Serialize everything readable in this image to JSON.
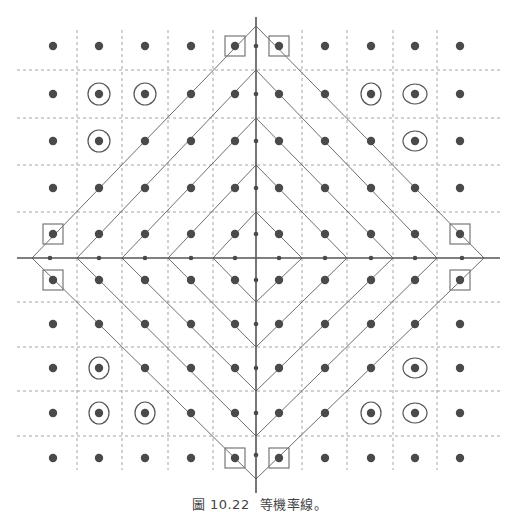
{
  "caption": {
    "figure_label": "圖 10.22",
    "title": "等機率線。"
  },
  "colors": {
    "dot": "#4a4a4a",
    "line": "#6e6e6e",
    "axis": "#555555",
    "grid": "#9a9a9a",
    "marker": "#777777"
  },
  "geometry": {
    "center": [
      256,
      258
    ],
    "h_axis": [
      17,
      500
    ],
    "v_axis": [
      17,
      493
    ],
    "dot_columns": [
      53,
      99,
      145,
      191,
      235,
      279,
      325,
      371,
      415,
      460
    ],
    "dot_rows": [
      46,
      94,
      141,
      188,
      234,
      280,
      324,
      368,
      413,
      458
    ],
    "grid_x": [
      77,
      122,
      168,
      213,
      302,
      347,
      393,
      437
    ],
    "grid_y": [
      70,
      118,
      165,
      212,
      302,
      347,
      391,
      436
    ],
    "grid_extent": {
      "x": [
        17,
        500
      ],
      "y": [
        30,
        470
      ]
    },
    "axis_dots_x": [
      50,
      99,
      145,
      191,
      235,
      279,
      325,
      371,
      415,
      462
    ],
    "axis_dots_y": [
      46,
      94,
      141,
      188,
      234,
      280,
      324,
      368,
      413,
      455
    ]
  },
  "diamonds": [
    {
      "left": 32,
      "top": 26,
      "right": 484,
      "bottom": 479
    },
    {
      "left": 77,
      "top": 70,
      "right": 437,
      "bottom": 436
    },
    {
      "left": 122,
      "top": 118,
      "right": 393,
      "bottom": 391
    },
    {
      "left": 168,
      "top": 165,
      "right": 347,
      "bottom": 347
    },
    {
      "left": 213,
      "top": 212,
      "right": 302,
      "bottom": 302
    }
  ],
  "rings": [
    {
      "x": 99,
      "y": 94,
      "rx": 11,
      "ry": 11
    },
    {
      "x": 145,
      "y": 94,
      "rx": 11,
      "ry": 11
    },
    {
      "x": 99,
      "y": 141,
      "rx": 11,
      "ry": 11
    },
    {
      "x": 371,
      "y": 94,
      "rx": 10,
      "ry": 11
    },
    {
      "x": 415,
      "y": 94,
      "rx": 12,
      "ry": 10
    },
    {
      "x": 415,
      "y": 141,
      "rx": 12,
      "ry": 10
    },
    {
      "x": 99,
      "y": 368,
      "rx": 10,
      "ry": 11
    },
    {
      "x": 99,
      "y": 413,
      "rx": 10,
      "ry": 11
    },
    {
      "x": 145,
      "y": 413,
      "rx": 10,
      "ry": 11
    },
    {
      "x": 415,
      "y": 368,
      "rx": 12,
      "ry": 10
    },
    {
      "x": 371,
      "y": 413,
      "rx": 10,
      "ry": 11
    },
    {
      "x": 415,
      "y": 413,
      "rx": 12,
      "ry": 10
    }
  ],
  "squares": [
    {
      "x": 235,
      "y": 46
    },
    {
      "x": 279,
      "y": 46
    },
    {
      "x": 53,
      "y": 234
    },
    {
      "x": 460,
      "y": 234
    },
    {
      "x": 53,
      "y": 280
    },
    {
      "x": 460,
      "y": 280
    },
    {
      "x": 235,
      "y": 458
    },
    {
      "x": 279,
      "y": 458
    }
  ]
}
